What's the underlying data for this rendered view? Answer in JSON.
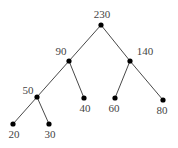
{
  "diagram": {
    "type": "binary-tree",
    "nodes": [
      {
        "id": "n230",
        "value": "230",
        "x": 101,
        "y": 25,
        "lx": 102,
        "ly": 18,
        "anchor": "middle"
      },
      {
        "id": "n90",
        "value": "90",
        "x": 69,
        "y": 61,
        "lx": 61,
        "ly": 55,
        "anchor": "middle"
      },
      {
        "id": "n140",
        "value": "140",
        "x": 130,
        "y": 61,
        "lx": 145,
        "ly": 55,
        "anchor": "middle"
      },
      {
        "id": "n50",
        "value": "50",
        "x": 37,
        "y": 97,
        "lx": 28,
        "ly": 94,
        "anchor": "middle"
      },
      {
        "id": "n40",
        "value": "40",
        "x": 84,
        "y": 98,
        "lx": 85,
        "ly": 112,
        "anchor": "middle"
      },
      {
        "id": "n60",
        "value": "60",
        "x": 115,
        "y": 98,
        "lx": 114,
        "ly": 112,
        "anchor": "middle"
      },
      {
        "id": "n80",
        "value": "80",
        "x": 163,
        "y": 100,
        "lx": 162,
        "ly": 114,
        "anchor": "middle"
      },
      {
        "id": "n20",
        "value": "20",
        "x": 13,
        "y": 124,
        "lx": 14,
        "ly": 138,
        "anchor": "middle"
      },
      {
        "id": "n30",
        "value": "30",
        "x": 49,
        "y": 124,
        "lx": 50,
        "ly": 138,
        "anchor": "middle"
      }
    ],
    "edges": [
      {
        "from": "n230",
        "to": "n90"
      },
      {
        "from": "n230",
        "to": "n140"
      },
      {
        "from": "n90",
        "to": "n50"
      },
      {
        "from": "n90",
        "to": "n40"
      },
      {
        "from": "n140",
        "to": "n60"
      },
      {
        "from": "n140",
        "to": "n80"
      },
      {
        "from": "n50",
        "to": "n20"
      },
      {
        "from": "n50",
        "to": "n30"
      }
    ],
    "colors": {
      "edge": "#333333",
      "node": "#000000",
      "label": "#444444",
      "background": "#ffffff"
    }
  }
}
